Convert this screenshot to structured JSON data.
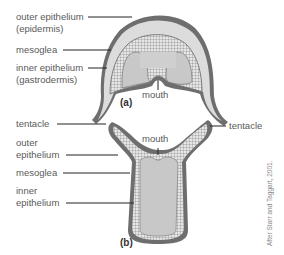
{
  "diagram": {
    "panel_a": {
      "id_label": "(a)",
      "labels": {
        "outer_epithelium": "outer epithelium",
        "outer_epithelium_alt": "(epidermis)",
        "mesoglea": "mesoglea",
        "inner_epithelium": "inner epithelium",
        "inner_epithelium_alt": "(gastrodermis)",
        "mouth": "mouth",
        "tentacle": "tentacle"
      }
    },
    "panel_b": {
      "id_label": "(b)",
      "labels": {
        "tentacle": "tentacle",
        "outer_epithelium_1": "outer",
        "outer_epithelium_2": "epithelium",
        "mesoglea": "mesoglea",
        "inner_epithelium_1": "inner",
        "inner_epithelium_2": "epithelium",
        "mouth": "mouth"
      }
    },
    "credit": "After Starr and Taggart, 2001.",
    "colors": {
      "outer_wall": "#6e6e6e",
      "mesoglea": "#d9d9d9",
      "cavity": "#c8c8c8",
      "leader_line": "#222222"
    }
  }
}
